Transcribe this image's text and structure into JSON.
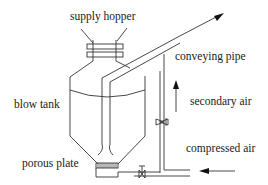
{
  "diagram": {
    "type": "process schematic",
    "labels": {
      "supply_hopper": "supply hopper",
      "conveying_pipe": "conveying pipe",
      "blow_tank": "blow tank",
      "secondary_air": "secondary air",
      "compressed_air": "compressed air",
      "porous_plate": "porous plate"
    },
    "components": [
      "supply hopper",
      "blow tank",
      "conveying pipe",
      "porous plate",
      "secondary air line with valve",
      "compressed air inlet with valve"
    ],
    "colors": {
      "line": "#333333",
      "text": "#1a1a1a",
      "background": "#ffffff"
    }
  }
}
